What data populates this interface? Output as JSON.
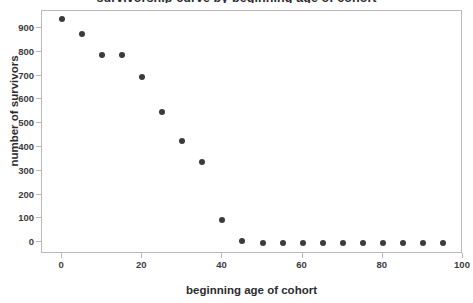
{
  "chart_data": {
    "type": "scatter",
    "title": "survivorship curve by beginning age of cohort",
    "title_clipped": true,
    "xlabel": "beginning age of cohort",
    "ylabel": "number of survivors",
    "xlim": [
      -5,
      100
    ],
    "ylim": [
      -45,
      975
    ],
    "xticks": [
      0,
      20,
      40,
      60,
      80,
      100
    ],
    "yticks": [
      0,
      100,
      200,
      300,
      400,
      500,
      600,
      700,
      800,
      900
    ],
    "xtick_labels": [
      "0",
      "20",
      "40",
      "60",
      "80",
      "100"
    ],
    "ytick_labels": [
      "0",
      "100",
      "200",
      "300",
      "400",
      "500",
      "600",
      "700",
      "800",
      "900"
    ],
    "grid": false,
    "legend": null,
    "marker_color": "#3a3a3f",
    "frame_color": "#b9b9bd",
    "background": "#ffffff",
    "x": [
      0,
      5,
      10,
      15,
      20,
      25,
      30,
      35,
      40,
      45,
      50,
      55,
      60,
      65,
      70,
      75,
      80,
      85,
      90,
      95
    ],
    "y": [
      940,
      880,
      790,
      790,
      698,
      550,
      430,
      342,
      98,
      10,
      0,
      0,
      0,
      0,
      0,
      0,
      0,
      0,
      0,
      0
    ],
    "points": [
      {
        "x": 0,
        "y": 940
      },
      {
        "x": 5,
        "y": 880
      },
      {
        "x": 10,
        "y": 790
      },
      {
        "x": 15,
        "y": 790
      },
      {
        "x": 20,
        "y": 698
      },
      {
        "x": 25,
        "y": 550
      },
      {
        "x": 30,
        "y": 430
      },
      {
        "x": 35,
        "y": 342
      },
      {
        "x": 40,
        "y": 98
      },
      {
        "x": 45,
        "y": 10
      },
      {
        "x": 50,
        "y": 0
      },
      {
        "x": 55,
        "y": 0
      },
      {
        "x": 60,
        "y": 0
      },
      {
        "x": 65,
        "y": 0
      },
      {
        "x": 70,
        "y": 0
      },
      {
        "x": 75,
        "y": 0
      },
      {
        "x": 80,
        "y": 0
      },
      {
        "x": 85,
        "y": 0
      },
      {
        "x": 90,
        "y": 0
      },
      {
        "x": 95,
        "y": 0
      }
    ]
  }
}
